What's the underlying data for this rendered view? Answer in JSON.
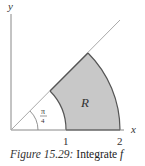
{
  "figure": {
    "axis_labels": {
      "x": "x",
      "y": "y"
    },
    "tick_labels": [
      "1",
      "2"
    ],
    "angle_label": {
      "numerator": "π",
      "denominator": "4"
    },
    "region_label": "R",
    "colors": {
      "region_fill": "#c8c8c8",
      "region_stroke": "#555555",
      "axis": "#888888",
      "diagonal": "#aaaaaa"
    }
  },
  "caption": {
    "figure_number": "Figure 15.29:",
    "text": "Integrate ",
    "variable": "f"
  }
}
